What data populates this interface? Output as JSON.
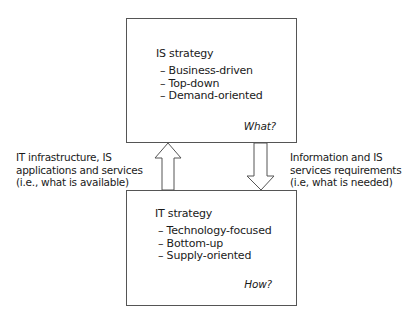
{
  "top_box": {
    "title": "IS strategy",
    "items": [
      "Business-driven",
      "Top-down",
      "Demand-oriented"
    ],
    "question": "What?"
  },
  "bottom_box": {
    "title": "IT strategy",
    "items": [
      "Technology-focused",
      "Bottom-up",
      "Supply-oriented"
    ],
    "question": "How?"
  },
  "left_label": {
    "lines": [
      "IT infrastructure, IS",
      "applications and services",
      "(i.e., what is available)"
    ]
  },
  "right_label": {
    "lines": [
      "Information and IS",
      "services requirements",
      "(i.e, what is needed)"
    ]
  },
  "arrows": {
    "up": "from IT strategy to IS strategy",
    "down": "from IS strategy to IT strategy"
  }
}
